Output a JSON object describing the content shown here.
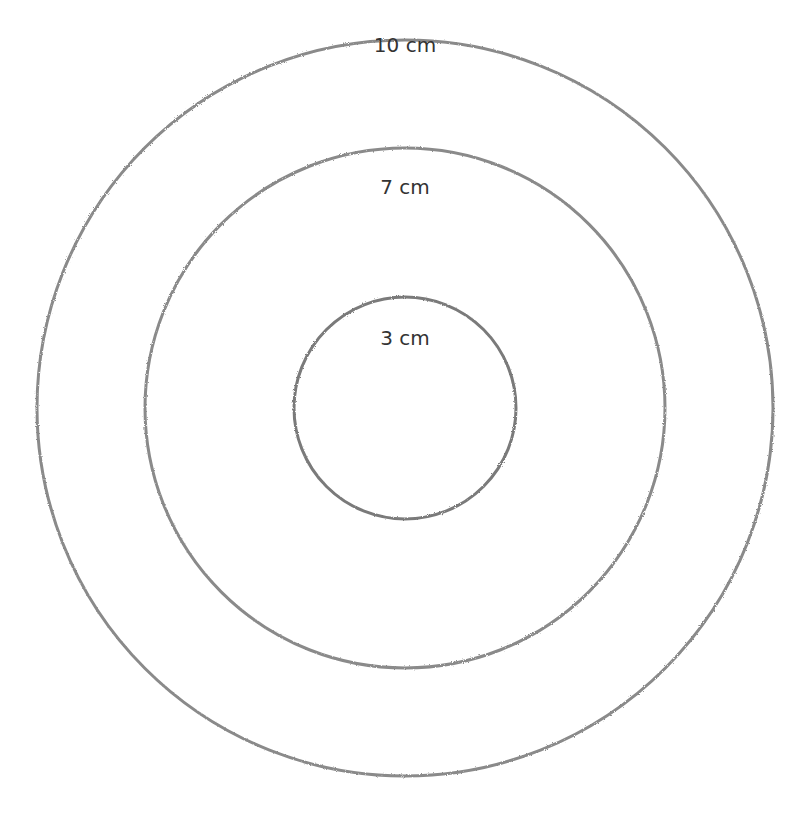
{
  "diagram": {
    "type": "concentric-circles",
    "stroke_color": "#8a8a8a",
    "circles": [
      {
        "label": "10 cm",
        "cx": 405,
        "cy": 408,
        "r": 368,
        "label_x": 405,
        "label_y": 33
      },
      {
        "label": "7 cm",
        "cx": 405,
        "cy": 408,
        "r": 260,
        "label_x": 405,
        "label_y": 175
      },
      {
        "label": "3 cm",
        "cx": 405,
        "cy": 408,
        "r": 111,
        "label_x": 405,
        "label_y": 326
      }
    ]
  }
}
